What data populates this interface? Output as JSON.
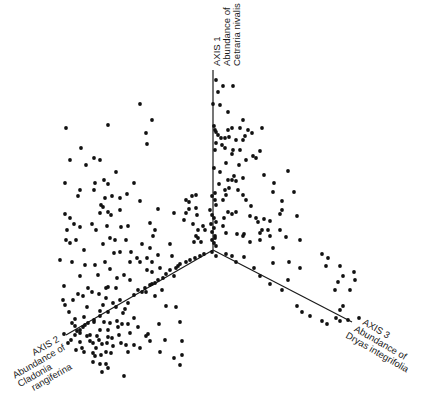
{
  "chart_data": {
    "type": "scatter",
    "subtype": "3d-scatter-ordination",
    "title": "",
    "grid": false,
    "legend": null,
    "origin_px": [
      213,
      250
    ],
    "axes": [
      {
        "id": "axis1",
        "name": "AXIS 1",
        "label": "Abundance of Cetraria nivalis",
        "label_line1": "AXIS 1",
        "label_line2": "Abundance of",
        "label_line3": "Cetraria nivalis",
        "end_px": [
          213,
          70
        ],
        "direction": "up"
      },
      {
        "id": "axis2",
        "name": "AXIS 2",
        "label": "Abundance of Cladonia rangiferina",
        "label_line1": "AXIS 2",
        "label_line2": "Abundance of",
        "label_line3": "Cladonia",
        "label_line4": "rangiferina",
        "end_px": [
          66,
          335
        ],
        "direction": "down-left"
      },
      {
        "id": "axis3",
        "name": "AXIS 3",
        "label": "Abundance of Dryas integrifolia",
        "label_line1": "AXIS 3",
        "label_line2": "Abundance of",
        "label_line3": "Dryas integrifolia",
        "end_px": [
          352,
          322
        ],
        "direction": "down-right"
      }
    ],
    "points_px": [
      [
        216,
        80
      ],
      [
        223,
        86
      ],
      [
        233,
        86
      ],
      [
        218,
        92
      ],
      [
        220,
        105
      ],
      [
        213,
        104
      ],
      [
        228,
        112
      ],
      [
        243,
        120
      ],
      [
        240,
        128
      ],
      [
        262,
        128
      ],
      [
        228,
        130
      ],
      [
        232,
        128
      ],
      [
        248,
        130
      ],
      [
        252,
        133
      ],
      [
        218,
        135
      ],
      [
        229,
        137
      ],
      [
        221,
        138
      ],
      [
        225,
        138
      ],
      [
        236,
        140
      ],
      [
        215,
        130
      ],
      [
        216,
        132
      ],
      [
        214,
        126
      ],
      [
        215,
        150
      ],
      [
        216,
        143
      ],
      [
        222,
        145
      ],
      [
        225,
        148
      ],
      [
        233,
        150
      ],
      [
        245,
        136
      ],
      [
        243,
        140
      ],
      [
        246,
        160
      ],
      [
        253,
        156
      ],
      [
        256,
        158
      ],
      [
        232,
        154
      ],
      [
        260,
        151
      ],
      [
        226,
        163
      ],
      [
        239,
        165
      ],
      [
        240,
        150
      ],
      [
        214,
        168
      ],
      [
        220,
        172
      ],
      [
        234,
        176
      ],
      [
        228,
        180
      ],
      [
        232,
        180
      ],
      [
        236,
        181
      ],
      [
        243,
        178
      ],
      [
        264,
        175
      ],
      [
        274,
        183
      ],
      [
        288,
        171
      ],
      [
        273,
        192
      ],
      [
        294,
        192
      ],
      [
        282,
        201
      ],
      [
        229,
        188
      ],
      [
        219,
        184
      ],
      [
        225,
        190
      ],
      [
        215,
        193
      ],
      [
        226,
        195
      ],
      [
        238,
        190
      ],
      [
        243,
        195
      ],
      [
        223,
        200
      ],
      [
        212,
        196
      ],
      [
        215,
        200
      ],
      [
        216,
        205
      ],
      [
        210,
        210
      ],
      [
        212,
        215
      ],
      [
        214,
        218
      ],
      [
        216,
        222
      ],
      [
        211,
        224
      ],
      [
        214,
        228
      ],
      [
        212,
        232
      ],
      [
        215,
        236
      ],
      [
        212,
        240
      ],
      [
        214,
        243
      ],
      [
        216,
        246
      ],
      [
        224,
        218
      ],
      [
        228,
        212
      ],
      [
        232,
        214
      ],
      [
        236,
        212
      ],
      [
        223,
        226
      ],
      [
        205,
        230
      ],
      [
        215,
        238
      ],
      [
        226,
        233
      ],
      [
        237,
        234
      ],
      [
        244,
        234
      ],
      [
        250,
        242
      ],
      [
        260,
        233
      ],
      [
        268,
        230
      ],
      [
        258,
        222
      ],
      [
        256,
        218
      ],
      [
        264,
        219
      ],
      [
        250,
        216
      ],
      [
        246,
        200
      ],
      [
        251,
        206
      ],
      [
        270,
        221
      ],
      [
        280,
        214
      ],
      [
        286,
        237
      ],
      [
        273,
        248
      ],
      [
        289,
        262
      ],
      [
        273,
        263
      ],
      [
        243,
        236
      ],
      [
        260,
        240
      ],
      [
        270,
        236
      ],
      [
        280,
        230
      ],
      [
        297,
        216
      ],
      [
        300,
        240
      ],
      [
        282,
        210
      ],
      [
        262,
        230
      ],
      [
        212,
        252
      ],
      [
        216,
        256
      ],
      [
        226,
        254
      ],
      [
        232,
        256
      ],
      [
        236,
        262
      ],
      [
        244,
        257
      ],
      [
        254,
        268
      ],
      [
        260,
        276
      ],
      [
        270,
        284
      ],
      [
        282,
        290
      ],
      [
        297,
        306
      ],
      [
        302,
        312
      ],
      [
        310,
        316
      ],
      [
        322,
        321
      ],
      [
        327,
        324
      ],
      [
        336,
        318
      ],
      [
        340,
        321
      ],
      [
        348,
        320
      ],
      [
        335,
        290
      ],
      [
        340,
        310
      ],
      [
        343,
        306
      ],
      [
        338,
        282
      ],
      [
        343,
        276
      ],
      [
        350,
        290
      ],
      [
        355,
        280
      ],
      [
        359,
        318
      ],
      [
        322,
        254
      ],
      [
        328,
        258
      ],
      [
        340,
        266
      ],
      [
        354,
        272
      ],
      [
        326,
        266
      ],
      [
        300,
        268
      ],
      [
        288,
        280
      ],
      [
        186,
        200
      ],
      [
        189,
        202
      ],
      [
        189,
        209
      ],
      [
        196,
        208
      ],
      [
        197,
        215
      ],
      [
        193,
        224
      ],
      [
        198,
        230
      ],
      [
        196,
        236
      ],
      [
        194,
        242
      ],
      [
        158,
        209
      ],
      [
        150,
        223
      ],
      [
        155,
        230
      ],
      [
        174,
        213
      ],
      [
        184,
        220
      ],
      [
        192,
        196
      ],
      [
        196,
        195
      ],
      [
        186,
        213
      ],
      [
        203,
        226
      ],
      [
        198,
        238
      ],
      [
        201,
        242
      ],
      [
        140,
        104
      ],
      [
        152,
        120
      ],
      [
        146,
        133
      ],
      [
        147,
        144
      ],
      [
        108,
        125
      ],
      [
        66,
        128
      ],
      [
        81,
        148
      ],
      [
        94,
        158
      ],
      [
        70,
        160
      ],
      [
        100,
        160
      ],
      [
        86,
        165
      ],
      [
        116,
        172
      ],
      [
        95,
        183
      ],
      [
        104,
        180
      ],
      [
        108,
        184
      ],
      [
        112,
        196
      ],
      [
        65,
        183
      ],
      [
        80,
        190
      ],
      [
        78,
        196
      ],
      [
        94,
        190
      ],
      [
        105,
        198
      ],
      [
        120,
        198
      ],
      [
        120,
        210
      ],
      [
        101,
        205
      ],
      [
        103,
        207
      ],
      [
        108,
        212
      ],
      [
        111,
        215
      ],
      [
        100,
        213
      ],
      [
        92,
        224
      ],
      [
        107,
        226
      ],
      [
        121,
        227
      ],
      [
        96,
        230
      ],
      [
        110,
        238
      ],
      [
        103,
        244
      ],
      [
        115,
        240
      ],
      [
        134,
        183
      ],
      [
        127,
        194
      ],
      [
        140,
        201
      ],
      [
        128,
        226
      ],
      [
        65,
        214
      ],
      [
        70,
        218
      ],
      [
        67,
        230
      ],
      [
        74,
        224
      ],
      [
        80,
        227
      ],
      [
        76,
        240
      ],
      [
        84,
        250
      ],
      [
        66,
        240
      ],
      [
        70,
        243
      ],
      [
        85,
        265
      ],
      [
        95,
        265
      ],
      [
        105,
        262
      ],
      [
        98,
        275
      ],
      [
        106,
        288
      ],
      [
        60,
        260
      ],
      [
        64,
        286
      ],
      [
        80,
        276
      ],
      [
        72,
        262
      ],
      [
        63,
        300
      ],
      [
        65,
        305
      ],
      [
        84,
        317
      ],
      [
        100,
        311
      ],
      [
        106,
        298
      ],
      [
        130,
        262
      ],
      [
        140,
        262
      ],
      [
        147,
        258
      ],
      [
        152,
        262
      ],
      [
        155,
        296
      ],
      [
        170,
        244
      ],
      [
        174,
        276
      ],
      [
        153,
        236
      ],
      [
        147,
        270
      ],
      [
        162,
        290
      ],
      [
        83,
        296
      ],
      [
        87,
        307
      ],
      [
        75,
        319
      ],
      [
        94,
        322
      ],
      [
        80,
        330
      ],
      [
        90,
        341
      ],
      [
        96,
        348
      ],
      [
        102,
        344
      ],
      [
        108,
        337
      ],
      [
        110,
        323
      ],
      [
        112,
        338
      ],
      [
        118,
        327
      ],
      [
        122,
        324
      ],
      [
        125,
        309
      ],
      [
        128,
        324
      ],
      [
        130,
        333
      ],
      [
        121,
        343
      ],
      [
        111,
        353
      ],
      [
        106,
        352
      ],
      [
        93,
        353
      ],
      [
        77,
        331
      ],
      [
        71,
        340
      ],
      [
        68,
        343
      ],
      [
        80,
        342
      ],
      [
        76,
        350
      ],
      [
        84,
        352
      ],
      [
        93,
        343
      ],
      [
        100,
        330
      ],
      [
        104,
        322
      ],
      [
        117,
        321
      ],
      [
        108,
        330
      ],
      [
        119,
        335
      ],
      [
        126,
        345
      ],
      [
        113,
        346
      ],
      [
        107,
        343
      ],
      [
        101,
        355
      ],
      [
        99,
        340
      ],
      [
        87,
        336
      ],
      [
        97,
        336
      ],
      [
        95,
        356
      ],
      [
        90,
        335
      ],
      [
        85,
        325
      ],
      [
        75,
        326
      ],
      [
        103,
        305
      ],
      [
        113,
        303
      ],
      [
        123,
        313
      ],
      [
        134,
        318
      ],
      [
        138,
        327
      ],
      [
        146,
        336
      ],
      [
        150,
        341
      ],
      [
        148,
        334
      ],
      [
        159,
        324
      ],
      [
        166,
        306
      ],
      [
        176,
        307
      ],
      [
        180,
        322
      ],
      [
        182,
        341
      ],
      [
        182,
        355
      ],
      [
        165,
        340
      ],
      [
        128,
        352
      ],
      [
        140,
        348
      ],
      [
        120,
        300
      ],
      [
        128,
        303
      ],
      [
        134,
        295
      ],
      [
        138,
        290
      ],
      [
        145,
        288
      ],
      [
        150,
        285
      ],
      [
        152,
        284
      ],
      [
        155,
        283
      ],
      [
        158,
        280
      ],
      [
        163,
        278
      ],
      [
        166,
        274
      ],
      [
        170,
        270
      ],
      [
        176,
        268
      ],
      [
        178,
        266
      ],
      [
        180,
        264
      ],
      [
        186,
        262
      ],
      [
        190,
        260
      ],
      [
        195,
        258
      ],
      [
        200,
        256
      ],
      [
        204,
        254
      ],
      [
        146,
        292
      ],
      [
        142,
        292
      ],
      [
        116,
        307
      ],
      [
        108,
        312
      ],
      [
        100,
        316
      ],
      [
        94,
        320
      ],
      [
        88,
        323
      ],
      [
        83,
        327
      ],
      [
        80,
        333
      ],
      [
        75,
        335
      ],
      [
        150,
        248
      ],
      [
        158,
        255
      ],
      [
        172,
        256
      ],
      [
        160,
        268
      ],
      [
        130,
        280
      ],
      [
        152,
        272
      ],
      [
        142,
        244
      ],
      [
        126,
        240
      ],
      [
        120,
        252
      ],
      [
        131,
        252
      ],
      [
        137,
        258
      ],
      [
        114,
        253
      ],
      [
        110,
        269
      ],
      [
        117,
        278
      ],
      [
        124,
        275
      ],
      [
        116,
        288
      ],
      [
        108,
        287
      ],
      [
        99,
        294
      ],
      [
        92,
        292
      ],
      [
        88,
        288
      ],
      [
        78,
        294
      ],
      [
        73,
        300
      ],
      [
        69,
        312
      ],
      [
        72,
        323
      ],
      [
        64,
        334
      ],
      [
        82,
        348
      ],
      [
        124,
        376
      ],
      [
        108,
        368
      ],
      [
        102,
        372
      ],
      [
        106,
        364
      ],
      [
        160,
        352
      ],
      [
        174,
        358
      ],
      [
        180,
        365
      ],
      [
        134,
        345
      ],
      [
        93,
        362
      ],
      [
        100,
        364
      ]
    ]
  }
}
